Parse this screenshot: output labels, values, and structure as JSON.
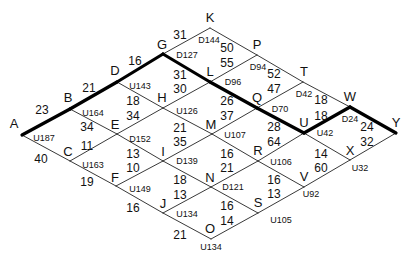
{
  "diagram": {
    "type": "lattice-grid",
    "nodes": [
      {
        "id": "A",
        "x": 22,
        "y": 135,
        "label": "A",
        "lx": 14,
        "ly": 124,
        "code": "U187",
        "cx": 44,
        "cy": 138
      },
      {
        "id": "B",
        "x": 70,
        "y": 109,
        "label": "B",
        "lx": 68,
        "ly": 98,
        "code": "U164",
        "cx": 93,
        "cy": 113
      },
      {
        "id": "C",
        "x": 70,
        "y": 161,
        "label": "C",
        "lx": 68,
        "ly": 152,
        "code": "U163",
        "cx": 93,
        "cy": 165
      },
      {
        "id": "D",
        "x": 117,
        "y": 82,
        "label": "D",
        "lx": 115,
        "ly": 71,
        "code": "U143",
        "cx": 140,
        "cy": 86
      },
      {
        "id": "E",
        "x": 117,
        "y": 134,
        "label": "E",
        "lx": 115,
        "ly": 125,
        "code": "D152",
        "cx": 140,
        "cy": 139
      },
      {
        "id": "F",
        "x": 116,
        "y": 186,
        "label": "F",
        "lx": 115,
        "ly": 178,
        "code": "U149",
        "cx": 140,
        "cy": 189
      },
      {
        "id": "G",
        "x": 163,
        "y": 54,
        "label": "G",
        "lx": 162,
        "ly": 45,
        "code": "D127",
        "cx": 187,
        "cy": 55
      },
      {
        "id": "H",
        "x": 163,
        "y": 108,
        "label": "H",
        "lx": 162,
        "ly": 98,
        "code": "U126",
        "cx": 187,
        "cy": 111
      },
      {
        "id": "I",
        "x": 163,
        "y": 161,
        "label": "I",
        "lx": 163,
        "ly": 152,
        "code": "D139",
        "cx": 187,
        "cy": 161
      },
      {
        "id": "J",
        "x": 163,
        "y": 213,
        "label": "J",
        "lx": 163,
        "ly": 204,
        "code": "U134",
        "cx": 187,
        "cy": 214
      },
      {
        "id": "K",
        "x": 210,
        "y": 28,
        "label": "K",
        "lx": 210,
        "ly": 18,
        "code": "D144",
        "cx": 209,
        "cy": 40
      },
      {
        "id": "L",
        "x": 210,
        "y": 82,
        "label": "L",
        "lx": 210,
        "ly": 72,
        "code": "D96",
        "cx": 233,
        "cy": 82
      },
      {
        "id": "M",
        "x": 212,
        "y": 134,
        "label": "M",
        "lx": 211,
        "ly": 125,
        "code": "U107",
        "cx": 235,
        "cy": 135
      },
      {
        "id": "N",
        "x": 211,
        "y": 187,
        "label": "N",
        "lx": 210,
        "ly": 178,
        "code": "D121",
        "cx": 233,
        "cy": 187
      },
      {
        "id": "O",
        "x": 211,
        "y": 239,
        "label": "O",
        "lx": 210,
        "ly": 229,
        "code": "U134",
        "cx": 211,
        "cy": 247
      },
      {
        "id": "P",
        "x": 257,
        "y": 55,
        "label": "P",
        "lx": 257,
        "ly": 45,
        "code": "D94",
        "cx": 258,
        "cy": 67
      },
      {
        "id": "Q",
        "x": 257,
        "y": 108,
        "label": "Q",
        "lx": 257,
        "ly": 98,
        "code": "D70",
        "cx": 280,
        "cy": 109
      },
      {
        "id": "R",
        "x": 258,
        "y": 161,
        "label": "R",
        "lx": 258,
        "ly": 151,
        "code": "U106",
        "cx": 281,
        "cy": 162
      },
      {
        "id": "S",
        "x": 258,
        "y": 213,
        "label": "S",
        "lx": 258,
        "ly": 203,
        "code": "U105",
        "cx": 281,
        "cy": 220
      },
      {
        "id": "T",
        "x": 303,
        "y": 82,
        "label": "T",
        "lx": 304,
        "ly": 72,
        "code": "D42",
        "cx": 304,
        "cy": 94
      },
      {
        "id": "U",
        "x": 304,
        "y": 133,
        "label": "U",
        "lx": 304,
        "ly": 123,
        "code": "U42",
        "cx": 325,
        "cy": 133
      },
      {
        "id": "V",
        "x": 304,
        "y": 187,
        "label": "V",
        "lx": 304,
        "ly": 177,
        "code": "U92",
        "cx": 311,
        "cy": 194
      },
      {
        "id": "W",
        "x": 350,
        "y": 107,
        "label": "W",
        "lx": 350,
        "ly": 97,
        "code": "D24",
        "cx": 350,
        "cy": 119
      },
      {
        "id": "X",
        "x": 350,
        "y": 160,
        "label": "X",
        "lx": 350,
        "ly": 151,
        "code": "U32",
        "cx": 360,
        "cy": 168
      },
      {
        "id": "Y",
        "x": 396,
        "y": 133,
        "label": "Y",
        "lx": 396,
        "ly": 123,
        "code": "",
        "cx": 0,
        "cy": 0
      }
    ],
    "edges": [
      {
        "from": "A",
        "to": "B",
        "weight": "23",
        "wx": 42,
        "wy": 110,
        "bold": true
      },
      {
        "from": "B",
        "to": "D",
        "weight": "21",
        "wx": 89,
        "wy": 88,
        "bold": true
      },
      {
        "from": "D",
        "to": "G",
        "weight": "16",
        "wx": 135,
        "wy": 61,
        "bold": true
      },
      {
        "from": "G",
        "to": "K",
        "weight": "31",
        "wx": 180,
        "wy": 35,
        "bold": false
      },
      {
        "from": "A",
        "to": "C",
        "weight": "40",
        "wx": 41,
        "wy": 159,
        "bold": false
      },
      {
        "from": "C",
        "to": "F",
        "weight": "19",
        "wx": 87,
        "wy": 182,
        "bold": false
      },
      {
        "from": "F",
        "to": "J",
        "weight": "16",
        "wx": 133,
        "wy": 208,
        "bold": false
      },
      {
        "from": "J",
        "to": "O",
        "weight": "21",
        "wx": 180,
        "wy": 235,
        "bold": false
      },
      {
        "from": "B",
        "to": "E",
        "weight": "34",
        "wx": 87,
        "wy": 127,
        "bold": false
      },
      {
        "from": "C",
        "to": "E",
        "weight": "11",
        "wx": 87,
        "wy": 146,
        "bold": false
      },
      {
        "from": "D",
        "to": "H",
        "weight": "18",
        "wx": 133,
        "wy": 101,
        "bold": false
      },
      {
        "from": "E",
        "to": "H",
        "weight": "34",
        "wx": 133,
        "wy": 116,
        "bold": false
      },
      {
        "from": "E",
        "to": "I",
        "weight": "13",
        "wx": 133,
        "wy": 154,
        "bold": false
      },
      {
        "from": "F",
        "to": "I",
        "weight": "10",
        "wx": 133,
        "wy": 168,
        "bold": false
      },
      {
        "from": "G",
        "to": "L",
        "weight": "31",
        "wx": 180,
        "wy": 75,
        "bold": true
      },
      {
        "from": "H",
        "to": "L",
        "weight": "30",
        "wx": 180,
        "wy": 89,
        "bold": false
      },
      {
        "from": "H",
        "to": "M",
        "weight": "21",
        "wx": 180,
        "wy": 128,
        "bold": false
      },
      {
        "from": "I",
        "to": "M",
        "weight": "35",
        "wx": 180,
        "wy": 142,
        "bold": false
      },
      {
        "from": "I",
        "to": "N",
        "weight": "18",
        "wx": 180,
        "wy": 180,
        "bold": false
      },
      {
        "from": "J",
        "to": "N",
        "weight": "13",
        "wx": 180,
        "wy": 195,
        "bold": false
      },
      {
        "from": "K",
        "to": "P",
        "weight": "50",
        "wx": 227,
        "wy": 48,
        "bold": false
      },
      {
        "from": "L",
        "to": "P",
        "weight": "55",
        "wx": 227,
        "wy": 63,
        "bold": false
      },
      {
        "from": "L",
        "to": "Q",
        "weight": "26",
        "wx": 227,
        "wy": 101,
        "bold": true
      },
      {
        "from": "M",
        "to": "Q",
        "weight": "37",
        "wx": 227,
        "wy": 116,
        "bold": false
      },
      {
        "from": "M",
        "to": "R",
        "weight": "16",
        "wx": 227,
        "wy": 154,
        "bold": false
      },
      {
        "from": "N",
        "to": "R",
        "weight": "21",
        "wx": 227,
        "wy": 168,
        "bold": false
      },
      {
        "from": "N",
        "to": "S",
        "weight": "16",
        "wx": 227,
        "wy": 206,
        "bold": false
      },
      {
        "from": "O",
        "to": "S",
        "weight": "14",
        "wx": 227,
        "wy": 221,
        "bold": false
      },
      {
        "from": "P",
        "to": "T",
        "weight": "52",
        "wx": 274,
        "wy": 74,
        "bold": false
      },
      {
        "from": "Q",
        "to": "T",
        "weight": "47",
        "wx": 274,
        "wy": 89,
        "bold": false
      },
      {
        "from": "Q",
        "to": "U",
        "weight": "28",
        "wx": 274,
        "wy": 127,
        "bold": true
      },
      {
        "from": "R",
        "to": "U",
        "weight": "64",
        "wx": 274,
        "wy": 142,
        "bold": false
      },
      {
        "from": "R",
        "to": "V",
        "weight": "16",
        "wx": 274,
        "wy": 180,
        "bold": false
      },
      {
        "from": "S",
        "to": "V",
        "weight": "13",
        "wx": 274,
        "wy": 194,
        "bold": false
      },
      {
        "from": "T",
        "to": "W",
        "weight": "18",
        "wx": 321,
        "wy": 100,
        "bold": false
      },
      {
        "from": "U",
        "to": "W",
        "weight": "18",
        "wx": 321,
        "wy": 116,
        "bold": true
      },
      {
        "from": "U",
        "to": "X",
        "weight": "14",
        "wx": 321,
        "wy": 154,
        "bold": false
      },
      {
        "from": "V",
        "to": "X",
        "weight": "60",
        "wx": 321,
        "wy": 168,
        "bold": false
      },
      {
        "from": "W",
        "to": "Y",
        "weight": "24",
        "wx": 367,
        "wy": 127,
        "bold": true
      },
      {
        "from": "X",
        "to": "Y",
        "weight": "32",
        "wx": 367,
        "wy": 142,
        "bold": false
      }
    ],
    "colors": {
      "line": "#222222",
      "bold_line": "#000000",
      "text": "#111111",
      "background": "#ffffff"
    }
  }
}
